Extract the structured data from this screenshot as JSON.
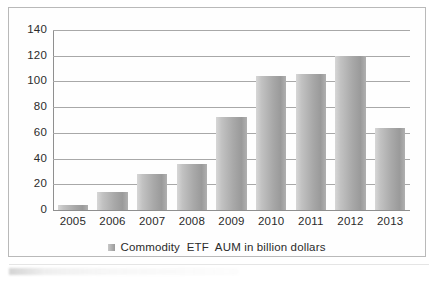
{
  "chart_data": {
    "type": "bar",
    "title": "",
    "xlabel": "",
    "ylabel": "",
    "categories": [
      "2005",
      "2006",
      "2007",
      "2008",
      "2009",
      "2010",
      "2011",
      "2012",
      "2013"
    ],
    "values": [
      4,
      14,
      28,
      35.5,
      72,
      104,
      106,
      120,
      64
    ],
    "series": [
      {
        "name": "Commodity  ETF  AUM in billion dollars",
        "values": [
          4,
          14,
          28,
          35.5,
          72,
          104,
          106,
          120,
          64
        ]
      }
    ],
    "ylim": [
      0,
      140
    ],
    "yticks": [
      0,
      20,
      40,
      60,
      80,
      100,
      120,
      140
    ],
    "ytick_labels": [
      "0",
      "20",
      "40",
      "60",
      "80",
      "100",
      "120",
      "140"
    ],
    "grid": true,
    "grid_axis": "y",
    "legend": {
      "position": "bottom-center",
      "entries": [
        "Commodity  ETF  AUM in billion dollars"
      ]
    },
    "bar_color_start": "#d7d7d7",
    "bar_color_end": "#9a9a9a",
    "grid_color": "#a8a8a8",
    "axis_color": "#8f8f8f",
    "text_color": "#2b2b2b",
    "frame_color": "#b9b9b9"
  },
  "legend": {
    "swatch_name": "legend-color-swatch",
    "label": "Commodity  ETF  AUM in billion dollars"
  }
}
